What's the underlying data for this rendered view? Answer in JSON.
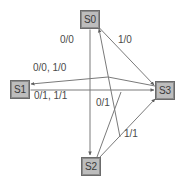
{
  "diagram": {
    "colors": {
      "node_fill": "#bdbdbd",
      "node_border": "#6b6b6b",
      "node_text": "#3a3a3a",
      "edge_stroke": "#7a7a7a",
      "label_text": "#4a4a4a",
      "background": "#ffffff"
    },
    "nodes": [
      {
        "id": "S0",
        "label": "S0",
        "x": 80,
        "y": 10,
        "w": 20,
        "h": 19
      },
      {
        "id": "S1",
        "label": "S1",
        "x": 10,
        "y": 80,
        "w": 20,
        "h": 19
      },
      {
        "id": "S2",
        "label": "S2",
        "x": 81,
        "y": 157,
        "w": 20,
        "h": 19
      },
      {
        "id": "S3",
        "label": "S3",
        "x": 155,
        "y": 81,
        "w": 20,
        "h": 19
      }
    ],
    "edge_labels": [
      {
        "id": "s0-s2",
        "text": "0/0",
        "x": 60,
        "y": 35
      },
      {
        "id": "s0-s3",
        "text": "1/0",
        "x": 118,
        "y": 35
      },
      {
        "id": "s3-s1",
        "text": "0/0, 1/0",
        "x": 33,
        "y": 63
      },
      {
        "id": "s1-s3",
        "text": "0/1, 1/1",
        "x": 34,
        "y": 91
      },
      {
        "id": "s2-s3-a",
        "text": "0/1",
        "x": 96,
        "y": 98
      },
      {
        "id": "s2-s3-b",
        "text": "1/1",
        "x": 124,
        "y": 129
      }
    ],
    "edges": [
      {
        "id": "edge-s0-s2",
        "from": "S0",
        "to": "S2",
        "label": "0/0"
      },
      {
        "id": "edge-s0-s3",
        "from": "S0",
        "to": "S3",
        "label": "1/0"
      },
      {
        "id": "edge-s3-s0",
        "from": "S3",
        "to": "S0",
        "label": ""
      },
      {
        "id": "edge-s3-s1",
        "from": "S3",
        "to": "S1",
        "label": "0/0, 1/0"
      },
      {
        "id": "edge-s1-s3",
        "from": "S1",
        "to": "S3",
        "label": "0/1, 1/1"
      },
      {
        "id": "edge-s2-s3-a",
        "from": "S2",
        "to": "S3",
        "label": "0/1"
      },
      {
        "id": "edge-s2-s3-b",
        "from": "S2",
        "to": "S3",
        "label": "1/1"
      }
    ]
  }
}
